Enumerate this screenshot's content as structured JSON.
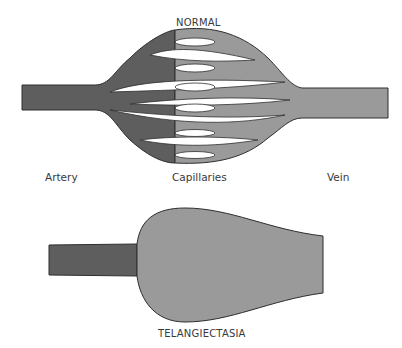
{
  "diagram": {
    "normal": {
      "title": "NORMAL",
      "labels": {
        "artery": "Artery",
        "capillaries": "Capillaries",
        "vein": "Vein"
      }
    },
    "telangiectasia": {
      "title": "TELANGIECTASIA"
    },
    "colors": {
      "artery": "#5e5e5e",
      "capillary_vein": "#9a9a9a",
      "outline": "#2e2e2e",
      "background": "#ffffff"
    }
  }
}
